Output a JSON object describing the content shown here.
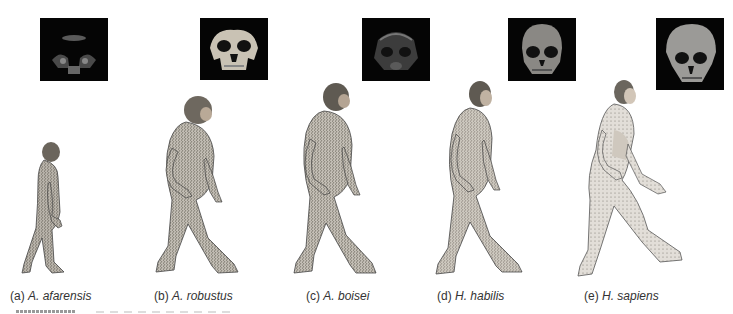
{
  "figure": {
    "panels": [
      {
        "letter": "(a)",
        "species": "A. afarensis",
        "skull_box": {
          "x": 40,
          "y": 18,
          "w": 68,
          "h": 63
        },
        "figure_box": {
          "x": 14,
          "y": 142,
          "w": 70,
          "h": 136
        },
        "skull_tone": "#3a3a3a"
      },
      {
        "letter": "(b)",
        "species": "A. robustus",
        "skull_box": {
          "x": 200,
          "y": 18,
          "w": 68,
          "h": 62
        },
        "figure_box": {
          "x": 148,
          "y": 96,
          "w": 98,
          "h": 182
        },
        "skull_tone": "#bdb6a8"
      },
      {
        "letter": "(c)",
        "species": "A. boisei",
        "skull_box": {
          "x": 362,
          "y": 18,
          "w": 68,
          "h": 63
        },
        "figure_box": {
          "x": 284,
          "y": 83,
          "w": 100,
          "h": 196
        },
        "skull_tone": "#4a4a4a"
      },
      {
        "letter": "(d)",
        "species": "H. habilis",
        "skull_box": {
          "x": 508,
          "y": 18,
          "w": 68,
          "h": 63
        },
        "figure_box": {
          "x": 428,
          "y": 80,
          "w": 106,
          "h": 199
        },
        "skull_tone": "#8a8a86"
      },
      {
        "letter": "(e)",
        "species": "H. sapiens",
        "skull_box": {
          "x": 656,
          "y": 18,
          "w": 68,
          "h": 72
        },
        "figure_box": {
          "x": 570,
          "y": 80,
          "w": 118,
          "h": 200
        },
        "skull_tone": "#9a9a98"
      }
    ],
    "captions_y": 289
  }
}
